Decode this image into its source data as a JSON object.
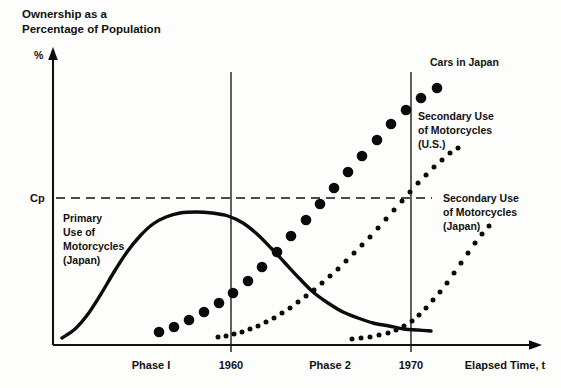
{
  "figure": {
    "title_line1": "Ownership as a",
    "title_line2": "Percentage of Population",
    "y_axis_unit": "%",
    "x_axis_label": "Elapsed Time, t",
    "cp_label": "Cp",
    "background_color": "#fdfdfb",
    "ink_color": "#0b0b0b"
  },
  "annotations": {
    "primary_use": {
      "line1": "Primary",
      "line2": "Use of",
      "line3": "Motorcycles",
      "line4": "(Japan)"
    },
    "cars_japan": {
      "line1": "Cars in Japan"
    },
    "secondary_us": {
      "line1": "Secondary Use",
      "line2": "of Motorcycles",
      "line3": "(U.S.)"
    },
    "secondary_japan": {
      "line1": "Secondary Use",
      "line2": "of Motorcycles",
      "line3": "(Japan)"
    }
  },
  "x_ticks": [
    {
      "label": "Phase I",
      "x_px": 151,
      "is_phase": true
    },
    {
      "label": "1960",
      "x_px": 231,
      "is_phase": false
    },
    {
      "label": "Phase 2",
      "x_px": 330,
      "is_phase": true
    },
    {
      "label": "1970",
      "x_px": 411,
      "is_phase": false
    },
    {
      "label": "Elapsed Time, t",
      "x_px": 505,
      "is_phase": true
    }
  ],
  "chart_data": {
    "type": "line",
    "title": "Ownership as a Percentage of Population",
    "xlabel": "Elapsed Time, t",
    "ylabel": "%",
    "grid": false,
    "legend": "inline-annotations",
    "axis_ranges": {
      "x_px": [
        53,
        540
      ],
      "y_px": [
        345,
        50
      ],
      "x_reference_years": {
        "1960": 231,
        "1970": 411
      }
    },
    "reference_lines": [
      {
        "name": "Cp",
        "orientation": "horizontal",
        "y_px": 198,
        "style": "dashed",
        "label": "Cp"
      },
      {
        "name": "1960",
        "orientation": "vertical",
        "x_px": 231,
        "style": "solid",
        "label": "1960"
      },
      {
        "name": "1970",
        "orientation": "vertical",
        "x_px": 411,
        "style": "solid",
        "label": "1970"
      }
    ],
    "series": [
      {
        "name": "Primary Use of Motorcycles (Japan)",
        "style": "solid-curve",
        "shape": "bell",
        "points": [
          [
            62,
            338
          ],
          [
            75,
            329
          ],
          [
            88,
            314
          ],
          [
            101,
            294
          ],
          [
            114,
            272
          ],
          [
            127,
            252
          ],
          [
            140,
            236
          ],
          [
            153,
            224
          ],
          [
            166,
            217
          ],
          [
            180,
            213
          ],
          [
            196,
            212
          ],
          [
            212,
            213
          ],
          [
            228,
            216
          ],
          [
            243,
            223
          ],
          [
            257,
            234
          ],
          [
            271,
            248
          ],
          [
            285,
            263
          ],
          [
            299,
            278
          ],
          [
            313,
            292
          ],
          [
            328,
            303
          ],
          [
            343,
            312
          ],
          [
            358,
            318
          ],
          [
            373,
            323
          ],
          [
            389,
            326
          ],
          [
            404,
            329
          ],
          [
            418,
            330
          ],
          [
            431,
            331
          ]
        ]
      },
      {
        "name": "Cars in Japan",
        "style": "large-dots",
        "dot_radius": 5.3,
        "points": [
          [
            159,
            332
          ],
          [
            174,
            327
          ],
          [
            189,
            320
          ],
          [
            204,
            312
          ],
          [
            219,
            303
          ],
          [
            233,
            293
          ],
          [
            248,
            281
          ],
          [
            262,
            267
          ],
          [
            277,
            252
          ],
          [
            291,
            236
          ],
          [
            306,
            220
          ],
          [
            320,
            204
          ],
          [
            334,
            188
          ],
          [
            348,
            172
          ],
          [
            362,
            156
          ],
          [
            377,
            140
          ],
          [
            391,
            124
          ],
          [
            406,
            110
          ],
          [
            421,
            98
          ],
          [
            437,
            88
          ]
        ]
      },
      {
        "name": "Secondary Use of Motorcycles (U.S.)",
        "style": "small-dots",
        "dot_radius": 2.5,
        "points": [
          [
            218,
            337
          ],
          [
            226,
            336
          ],
          [
            234,
            334
          ],
          [
            242,
            332
          ],
          [
            250,
            329
          ],
          [
            258,
            326
          ],
          [
            266,
            322
          ],
          [
            274,
            318
          ],
          [
            282,
            313
          ],
          [
            290,
            308
          ],
          [
            298,
            302
          ],
          [
            306,
            296
          ],
          [
            314,
            290
          ],
          [
            322,
            283
          ],
          [
            330,
            276
          ],
          [
            338,
            269
          ],
          [
            346,
            261
          ],
          [
            354,
            253
          ],
          [
            362,
            245
          ],
          [
            370,
            237
          ],
          [
            378,
            228
          ],
          [
            386,
            219
          ],
          [
            394,
            210
          ],
          [
            402,
            201
          ],
          [
            410,
            192
          ],
          [
            418,
            183
          ],
          [
            426,
            175
          ],
          [
            434,
            167
          ],
          [
            442,
            160
          ],
          [
            450,
            153
          ],
          [
            458,
            148
          ]
        ]
      },
      {
        "name": "Secondary Use of Motorcycles (Japan)",
        "style": "small-dots",
        "dot_radius": 2.5,
        "points": [
          [
            352,
            339
          ],
          [
            361,
            338
          ],
          [
            370,
            337
          ],
          [
            379,
            335
          ],
          [
            388,
            333
          ],
          [
            396,
            330
          ],
          [
            404,
            326
          ],
          [
            412,
            321
          ],
          [
            419,
            315
          ],
          [
            426,
            308
          ],
          [
            433,
            300
          ],
          [
            440,
            292
          ],
          [
            447,
            283
          ],
          [
            454,
            273
          ],
          [
            461,
            263
          ],
          [
            468,
            253
          ],
          [
            475,
            243
          ],
          [
            482,
            234
          ],
          [
            489,
            226
          ]
        ]
      }
    ]
  }
}
